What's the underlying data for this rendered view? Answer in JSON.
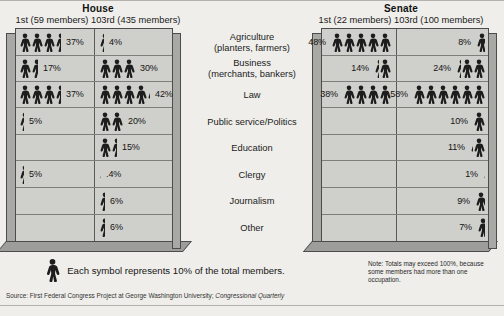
{
  "figure": {
    "legend_text": "Each symbol represents 10% of the total members.",
    "note": "Note: Totals may exceed 100%, because some members had more than one occupation.",
    "source": "Source: First Federal Congress Project at George Washington University; ",
    "source_italic": "Congressional Quarterly",
    "symbol_icon": "person-icon",
    "symbol_value_pct": 10,
    "colors": {
      "background": "#efeeea",
      "panel_face": "#cfcfcb",
      "panel_side": "#a8a8a4",
      "panel_bottom": "#9d9d99",
      "gridline": "#7d7d79",
      "figure_fill": "#1d1d1d"
    }
  },
  "chambers": {
    "house": {
      "title": "House",
      "subtitle": "1st (59 members) 103rd (435 members)",
      "col1_label": "1st (59 members)",
      "col2_label": "103rd (435 members)"
    },
    "senate": {
      "title": "Senate",
      "subtitle": "1st (22 members) 103rd (100 members)",
      "col1_label": "1st (22 members)",
      "col2_label": "103rd (100 members)"
    }
  },
  "occupations": [
    {
      "line1": "Agriculture",
      "line2": "(planters, farmers)"
    },
    {
      "line1": "Business",
      "line2": "(merchants, bankers)"
    },
    {
      "line1": "Law",
      "line2": ""
    },
    {
      "line1": "Public service/Politics",
      "line2": ""
    },
    {
      "line1": "Education",
      "line2": ""
    },
    {
      "line1": "Clergy",
      "line2": ""
    },
    {
      "line1": "Journalism",
      "line2": ""
    },
    {
      "line1": "Other",
      "line2": ""
    }
  ],
  "chart_data": {
    "type": "pictogram",
    "symbol_value_pct": 10,
    "ylabel": "Occupation",
    "xlabel": "Percent of total members",
    "categories": [
      "Agriculture (planters, farmers)",
      "Business (merchants, bankers)",
      "Law",
      "Public service/Politics",
      "Education",
      "Clergy",
      "Journalism",
      "Other"
    ],
    "series": [
      {
        "name": "House 1st (59 members)",
        "chamber": "House",
        "congress": "1st",
        "values": [
          37,
          17,
          37,
          5,
          null,
          5,
          null,
          null
        ],
        "labels": [
          "37%",
          "17%",
          "37%",
          "5%",
          "",
          "5%",
          "",
          ""
        ]
      },
      {
        "name": "House 103rd (435 members)",
        "chamber": "House",
        "congress": "103rd",
        "values": [
          4,
          30,
          42,
          20,
          15,
          0.4,
          6,
          6
        ],
        "labels": [
          "4%",
          "30%",
          "42%",
          "20%",
          "15%",
          ".4%",
          "6%",
          "6%"
        ]
      },
      {
        "name": "Senate 1st (22 members)",
        "chamber": "Senate",
        "congress": "1st",
        "values": [
          48,
          14,
          38,
          null,
          null,
          null,
          null,
          null
        ],
        "labels": [
          "48%",
          "14%",
          "38%",
          "",
          "",
          "",
          "",
          ""
        ]
      },
      {
        "name": "Senate 103rd (100 members)",
        "chamber": "Senate",
        "congress": "103rd",
        "values": [
          8,
          24,
          58,
          10,
          11,
          1,
          9,
          7
        ],
        "labels": [
          "8%",
          "24%",
          "58%",
          "10%",
          "11%",
          "1%",
          "9%",
          "7%"
        ]
      }
    ],
    "legend": "Each symbol represents 10% of the total members.",
    "note": "Note: Totals may exceed 100%, because some members had more than one occupation."
  }
}
